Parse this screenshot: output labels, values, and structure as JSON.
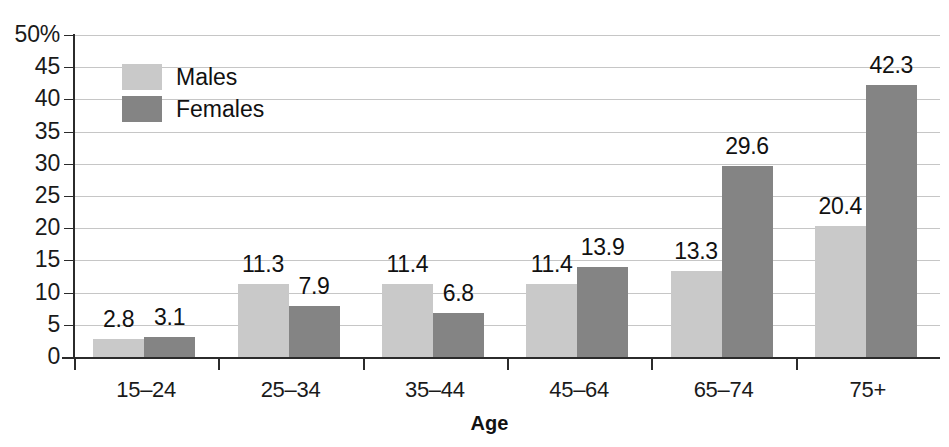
{
  "chart_data": {
    "type": "bar",
    "title": "",
    "xlabel": "Age",
    "ylabel": "",
    "categories": [
      "15–24",
      "25–34",
      "35–44",
      "45–64",
      "65–74",
      "75+"
    ],
    "series": [
      {
        "name": "Males",
        "color": "#c9c9c9",
        "values": [
          2.8,
          11.3,
          11.4,
          11.4,
          13.3,
          20.4
        ]
      },
      {
        "name": "Females",
        "color": "#848484",
        "values": [
          3.1,
          7.9,
          6.8,
          13.9,
          29.6,
          42.3
        ]
      }
    ],
    "ylim": [
      0,
      50
    ],
    "ytick_values": [
      0,
      5,
      10,
      15,
      20,
      25,
      30,
      35,
      40,
      45,
      50
    ],
    "ytick_labels": [
      "0",
      "5",
      "10",
      "15",
      "20",
      "25",
      "30",
      "35",
      "40",
      "45",
      "50%"
    ],
    "grid": true,
    "legend_position": "top-left",
    "data_labels": true
  },
  "legend": {
    "items": [
      {
        "label": "Males",
        "color": "#c9c9c9"
      },
      {
        "label": "Females",
        "color": "#848484"
      }
    ]
  },
  "axis": {
    "x_title": "Age"
  }
}
